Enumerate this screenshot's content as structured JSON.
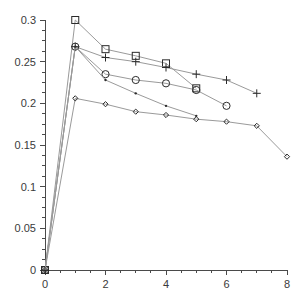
{
  "chart_data": {
    "type": "line",
    "title": "",
    "subtitle": "",
    "xlabel": "",
    "ylabel": "",
    "xlim": [
      0,
      8
    ],
    "ylim": [
      0,
      0.3
    ],
    "grid": false,
    "legend": "none",
    "x_ticks": [
      0,
      2,
      4,
      6,
      8
    ],
    "x_tick_labels": [
      "0",
      "2",
      "4",
      "6",
      "8"
    ],
    "x_minor_tick_step": 0.5,
    "y_ticks": [
      0,
      0.05,
      0.1,
      0.15,
      0.2,
      0.25,
      0.3
    ],
    "y_tick_labels": [
      "0",
      "0.05",
      "0.1",
      "0.15",
      "0.2",
      "0.25",
      "0.3"
    ],
    "y_minor_tick_step": 0.0125,
    "series": [
      {
        "name": "square-series",
        "marker": "square",
        "x": [
          0,
          1,
          2,
          3,
          4,
          5
        ],
        "values": [
          0,
          0.3,
          0.265,
          0.257,
          0.248,
          0.218
        ]
      },
      {
        "name": "plus-series",
        "marker": "plus",
        "x": [
          0,
          1,
          2,
          3,
          4,
          5,
          6,
          7
        ],
        "values": [
          0,
          0.268,
          0.255,
          0.25,
          0.243,
          0.235,
          0.228,
          0.212
        ]
      },
      {
        "name": "circle-series",
        "marker": "circle",
        "x": [
          0,
          1,
          2,
          3,
          4,
          5,
          6
        ],
        "values": [
          0,
          0.268,
          0.235,
          0.228,
          0.224,
          0.216,
          0.197
        ]
      },
      {
        "name": "dot-series",
        "marker": "dot",
        "x": [
          0,
          1,
          2,
          3,
          4,
          5
        ],
        "values": [
          0,
          0.268,
          0.228,
          0.212,
          0.197,
          0.185
        ]
      },
      {
        "name": "diamond-series",
        "marker": "diamond",
        "x": [
          0,
          1,
          2,
          3,
          4,
          5,
          6,
          7,
          8
        ],
        "values": [
          0,
          0.206,
          0.199,
          0.19,
          0.186,
          0.181,
          0.178,
          0.173,
          0.136
        ]
      }
    ],
    "colors": {
      "line": "#9a9a9a",
      "marker": "#2b2b2b",
      "axis": "#4a4a4a",
      "background": "#ffffff"
    }
  }
}
